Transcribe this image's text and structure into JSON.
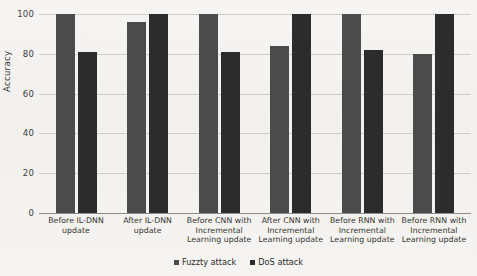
{
  "chart_data": {
    "type": "bar",
    "title": "",
    "xlabel": "",
    "ylabel": "Accuracy",
    "ylim": [
      0,
      100
    ],
    "yticks": [
      0,
      20,
      40,
      60,
      80,
      100
    ],
    "grid": true,
    "legend_position": "bottom-center",
    "categories": [
      "Before IL-DNN update",
      "After IL-DNN update",
      "Before CNN with Incremental Learning update",
      "After CNN  with Incremental Learning update",
      "Before RNN with Incremental Learning update",
      "Before RNN  with Incremental Learning update"
    ],
    "category_lines": [
      [
        "Before IL-DNN",
        "update"
      ],
      [
        "After IL-DNN",
        "update"
      ],
      [
        "Before CNN with",
        "Incremental",
        "Learning update"
      ],
      [
        "After CNN  with",
        "Incremental",
        "Learning update"
      ],
      [
        "Before RNN with",
        "Incremental",
        "Learning update"
      ],
      [
        "Before RNN  with",
        "Incremental",
        "Learning update"
      ]
    ],
    "series": [
      {
        "name": "Fuzzty attack",
        "color": "#4b4b4b",
        "values": [
          100,
          96,
          100,
          84,
          100,
          80
        ]
      },
      {
        "name": "DoS attack",
        "color": "#2c2c2c",
        "values": [
          81,
          100,
          81,
          100,
          82,
          100
        ]
      }
    ]
  },
  "legend": {
    "items": [
      {
        "label": "Fuzzty attack"
      },
      {
        "label": "DoS attack"
      }
    ]
  },
  "axes": {
    "y_title": "Accuracy",
    "y_ticks": [
      "100",
      "80",
      "60",
      "40",
      "20",
      "0"
    ]
  }
}
